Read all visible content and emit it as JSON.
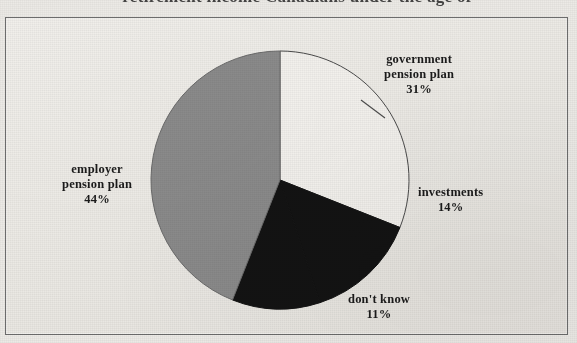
{
  "caption": {
    "text": "retirement income Canadians under the age of"
  },
  "chart_data": {
    "type": "pie",
    "title": "retirement income Canadians under the age of",
    "legend_position": "callout-labels",
    "grid": false,
    "unit": "%",
    "start_angle_deg": 0,
    "direction": "clockwise",
    "categories": [
      "government pension plan",
      "investments",
      "don't know",
      "employer pension plan"
    ],
    "values": [
      31,
      14,
      11,
      44
    ],
    "slices": [
      {
        "label": "government pension plan",
        "label_line1": "government",
        "label_line2": "pension plan",
        "value": 31,
        "value_text": "31%",
        "color": "#f2f0ec",
        "stroke": "#4a4a4a"
      },
      {
        "label": "investments",
        "label_line1": "investments",
        "label_line2": "",
        "value": 14,
        "value_text": "14%",
        "color": "#131313",
        "stroke": "#131313"
      },
      {
        "label": "don't know",
        "label_line1": "don't know",
        "label_line2": "",
        "value": 11,
        "value_text": "11%",
        "color": "#131313",
        "stroke": "#131313"
      },
      {
        "label": "employer pension plan",
        "label_line1": "employer",
        "label_line2": "pension plan",
        "value": 44,
        "value_text": "44%",
        "color": "#8a8a8a",
        "stroke": "#6a6a6a"
      }
    ]
  },
  "colors": {
    "paper": "#eceae6",
    "frame_border": "#6d6d6d",
    "slice_white": "#f2f0ec",
    "slice_black": "#131313",
    "slice_gray": "#8a8a8a",
    "text": "#1b1b1b"
  }
}
